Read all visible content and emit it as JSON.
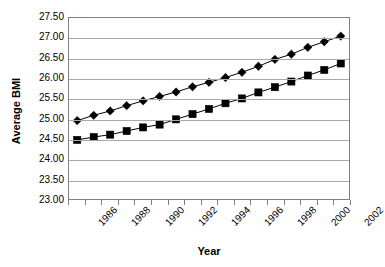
{
  "chart_data": {
    "type": "line",
    "title": "",
    "xlabel": "Year",
    "ylabel": "Average BMI",
    "ylim": [
      23.0,
      27.5
    ],
    "ytick_step": 0.5,
    "ytick_labels": [
      "27.50",
      "27.00",
      "26.50",
      "26.00",
      "25.50",
      "25.00",
      "24.50",
      "24.00",
      "23.50",
      "23.00"
    ],
    "ytick_values": [
      27.5,
      27.0,
      26.5,
      26.0,
      25.5,
      25.0,
      24.5,
      24.0,
      23.5,
      23.0
    ],
    "grid": true,
    "legend": "none",
    "x": [
      1986,
      1987,
      1988,
      1989,
      1990,
      1991,
      1992,
      1993,
      1994,
      1995,
      1996,
      1997,
      1998,
      1999,
      2000,
      2001,
      2002
    ],
    "xtick_labels": [
      "1986",
      "",
      "1988",
      "",
      "1990",
      "",
      "1992",
      "",
      "1994",
      "",
      "1996",
      "",
      "1998",
      "",
      "2000",
      "",
      "2002"
    ],
    "xtick_labels_major": [
      "1986",
      "1988",
      "1990",
      "1992",
      "1994",
      "1996",
      "1998",
      "2000",
      "2002"
    ],
    "series": [
      {
        "name": "diamond-series",
        "marker": "diamond",
        "color": "#000000",
        "values": [
          24.95,
          25.08,
          25.19,
          25.32,
          25.44,
          25.55,
          25.66,
          25.79,
          25.9,
          26.02,
          26.15,
          26.3,
          26.47,
          26.6,
          26.77,
          26.91,
          27.05
        ]
      },
      {
        "name": "square-series",
        "marker": "square",
        "color": "#000000",
        "values": [
          24.47,
          24.54,
          24.6,
          24.69,
          24.78,
          24.85,
          24.98,
          25.11,
          25.24,
          25.38,
          25.5,
          25.65,
          25.78,
          25.92,
          26.07,
          26.21,
          26.37
        ]
      }
    ]
  }
}
